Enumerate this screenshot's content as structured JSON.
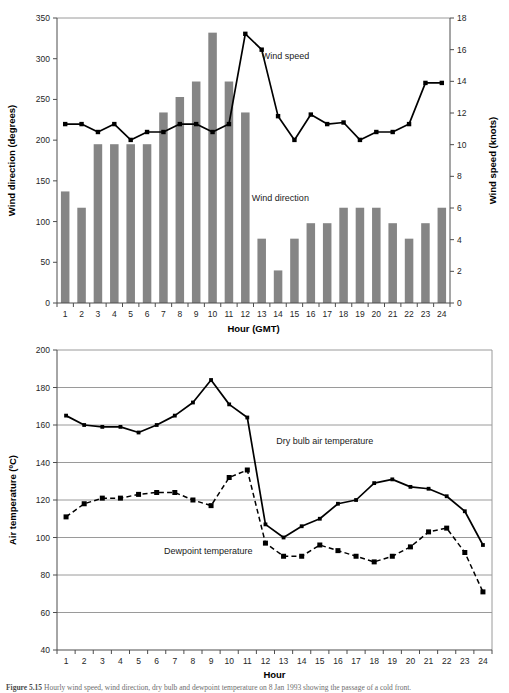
{
  "figure": {
    "caption_prefix": "Figure 5.15",
    "caption_text": "Hourly wind speed, wind direction, dry bulb and dewpoint temperature on 8 Jan 1993 showing the passage of a cold front."
  },
  "chart_data": [
    {
      "id": "wind",
      "type": "bar",
      "title": "",
      "xlabel": "Hour (GMT)",
      "ylabel": "Wind direction (degrees)",
      "y2label": "Wind speed (knots)",
      "categories": [
        "1",
        "2",
        "3",
        "4",
        "5",
        "6",
        "7",
        "8",
        "9",
        "10",
        "11",
        "12",
        "13",
        "14",
        "15",
        "16",
        "17",
        "18",
        "19",
        "20",
        "21",
        "22",
        "23",
        "24"
      ],
      "x": [
        1,
        2,
        3,
        4,
        5,
        6,
        7,
        8,
        9,
        10,
        11,
        12,
        13,
        14,
        15,
        16,
        17,
        18,
        19,
        20,
        21,
        22,
        23,
        24
      ],
      "ylim": [
        0,
        350
      ],
      "yticks": [
        0,
        50,
        100,
        150,
        200,
        250,
        300,
        350
      ],
      "y2lim": [
        0,
        18
      ],
      "y2ticks": [
        0,
        2,
        4,
        6,
        8,
        10,
        12,
        14,
        16,
        18
      ],
      "grid": false,
      "legend_position": "inline-annotation",
      "series": [
        {
          "name": "Wind direction",
          "render": "bar",
          "axis": "left",
          "unit": "degrees",
          "color": "#858585",
          "values": [
            137,
            117,
            195,
            195,
            195,
            195,
            234,
            253,
            272,
            332,
            272,
            234,
            79,
            40,
            79,
            98,
            98,
            117,
            117,
            117,
            98,
            79,
            98,
            117
          ]
        },
        {
          "name": "Wind speed",
          "render": "line-marker",
          "axis": "right",
          "unit": "knots",
          "color": "#000000",
          "values": [
            11.3,
            11.3,
            10.8,
            11.3,
            10.3,
            10.8,
            10.8,
            11.3,
            11.3,
            10.8,
            11.3,
            17.0,
            16.0,
            11.8,
            10.3,
            11.9,
            11.3,
            11.4,
            10.3,
            10.8,
            10.8,
            11.3,
            13.9,
            13.9
          ]
        }
      ],
      "annotations": [
        {
          "text": "Wind speed",
          "x": 13.0,
          "y": 300
        },
        {
          "text": "Wind direction",
          "x": 12.4,
          "y": 125
        }
      ]
    },
    {
      "id": "temperature",
      "type": "line",
      "title": "",
      "xlabel": "Hour",
      "ylabel": "Air temperature (ºC)",
      "categories": [
        "1",
        "2",
        "3",
        "4",
        "5",
        "6",
        "7",
        "8",
        "9",
        "10",
        "11",
        "12",
        "13",
        "14",
        "15",
        "16",
        "17",
        "18",
        "19",
        "20",
        "21",
        "22",
        "23",
        "24"
      ],
      "x": [
        1,
        2,
        3,
        4,
        5,
        6,
        7,
        8,
        9,
        10,
        11,
        12,
        13,
        14,
        15,
        16,
        17,
        18,
        19,
        20,
        21,
        22,
        23,
        24
      ],
      "ylim": [
        40,
        200
      ],
      "yticks": [
        40,
        60,
        80,
        100,
        120,
        140,
        160,
        180,
        200
      ],
      "grid": true,
      "legend_position": "inline-annotation",
      "series": [
        {
          "name": "Dry bulb air temperature",
          "render": "line-marker",
          "style": "solid",
          "color": "#000000",
          "values": [
            165,
            160,
            159,
            159,
            156,
            160,
            165,
            172,
            184,
            171,
            164,
            107,
            100,
            106,
            110,
            118,
            120,
            129,
            131,
            127,
            126,
            122,
            114,
            96
          ]
        },
        {
          "name": "Dewpoint temperature",
          "render": "line-marker",
          "style": "dashed",
          "color": "#000000",
          "values": [
            111,
            118,
            121,
            121,
            123,
            124,
            124,
            120,
            117,
            132,
            136,
            97,
            90,
            90,
            96,
            93,
            90,
            87,
            90,
            95,
            103,
            105,
            92,
            71
          ]
        }
      ],
      "annotations": [
        {
          "text": "Dry bulb air temperature",
          "x": 12.6,
          "y": 150
        },
        {
          "text": "Dewpoint temperature",
          "x": 6.4,
          "y": 91
        }
      ]
    }
  ]
}
